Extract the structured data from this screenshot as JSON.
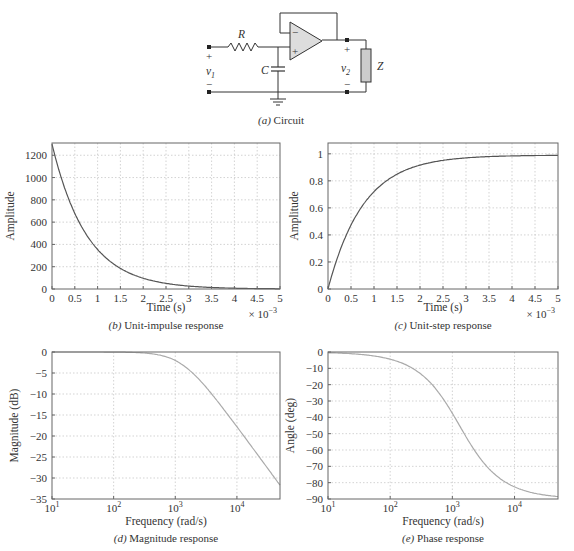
{
  "figure": {
    "circuit": {
      "caption_prefix": "(a)",
      "caption": "Circuit",
      "labels": {
        "R": "R",
        "C": "C",
        "Z": "Z",
        "v1": "v",
        "v1_sub": "1",
        "v2": "v",
        "v2_sub": "2",
        "plus": "+",
        "minus": "−"
      }
    },
    "colors": {
      "curve_time": "#555555",
      "curve_freq": "#aaaaaa",
      "grid": "#c8c8c8",
      "frame": "#666666",
      "opamp_fill": "#dddddd",
      "load_fill": "#cccccc"
    }
  },
  "chart_data": [
    {
      "id": "b",
      "type": "line",
      "title": "Unit-impulse response",
      "caption_prefix": "(b)",
      "xlabel": "Time (s)",
      "ylabel": "Amplitude",
      "x_multiplier": "× 10−3",
      "xlim": [
        0,
        5
      ],
      "ylim": [
        0,
        1310
      ],
      "xticks": [
        0,
        0.5,
        1,
        1.5,
        2,
        2.5,
        3,
        3.5,
        4,
        4.5,
        5
      ],
      "xtick_labels": [
        "0",
        "0.5",
        "1",
        "1.5",
        "2",
        "2.5",
        "3",
        "3.5",
        "4",
        "4.5",
        "5"
      ],
      "yticks": [
        0,
        200,
        400,
        600,
        800,
        1000,
        1200
      ],
      "ytick_labels": [
        "0",
        "200",
        "400",
        "600",
        "800",
        "1000",
        "1200"
      ],
      "grid": true,
      "x": [
        0,
        0.25,
        0.5,
        0.75,
        1,
        1.5,
        2,
        2.5,
        3,
        3.5,
        4,
        4.5,
        5
      ],
      "values": [
        1300,
        937,
        676,
        487,
        350,
        184,
        96,
        50,
        26,
        13.6,
        7.1,
        3.7,
        1.9
      ]
    },
    {
      "id": "c",
      "type": "line",
      "title": "Unit-step response",
      "caption_prefix": "(c)",
      "xlabel": "Time (s)",
      "ylabel": "Amplitude",
      "x_multiplier": "× 10−3",
      "xlim": [
        0,
        5
      ],
      "ylim": [
        0,
        1.08
      ],
      "xticks": [
        0,
        0.5,
        1,
        1.5,
        2,
        2.5,
        3,
        3.5,
        4,
        4.5,
        5
      ],
      "xtick_labels": [
        "0",
        "0.5",
        "1",
        "1.5",
        "2",
        "2.5",
        "3",
        "3.5",
        "4",
        "4.5",
        "5"
      ],
      "yticks": [
        0,
        0.2,
        0.4,
        0.6,
        0.8,
        1
      ],
      "ytick_labels": [
        "0",
        "0.2",
        "0.4",
        "0.6",
        "0.8",
        "1"
      ],
      "grid": true,
      "x": [
        0,
        0.25,
        0.5,
        0.75,
        1,
        1.5,
        2,
        2.5,
        3,
        3.5,
        4,
        4.5,
        5
      ],
      "values": [
        0,
        0.28,
        0.48,
        0.62,
        0.73,
        0.86,
        0.93,
        0.96,
        0.98,
        0.99,
        0.99,
        0.99,
        0.99
      ]
    },
    {
      "id": "d",
      "type": "line",
      "title": "Magnitude response",
      "caption_prefix": "(d)",
      "xlabel": "Frequency (rad/s)",
      "ylabel": "Magnitude (dB)",
      "xscale": "log",
      "xlim": [
        10,
        50000
      ],
      "ylim": [
        -35,
        0
      ],
      "xticks": [
        10,
        100,
        1000,
        10000
      ],
      "xtick_labels": [
        "10",
        "10",
        "10",
        "10"
      ],
      "xtick_exponents": [
        "1",
        "2",
        "3",
        "4"
      ],
      "yticks": [
        0,
        -5,
        -10,
        -15,
        -20,
        -25,
        -30,
        -35
      ],
      "ytick_labels": [
        "0",
        "−5",
        "−10",
        "−15",
        "−20",
        "−25",
        "−30",
        "−35"
      ],
      "grid": true,
      "x": [
        10,
        100,
        300,
        600,
        1000,
        1300,
        2000,
        3000,
        5000,
        10000,
        20000,
        50000
      ],
      "values": [
        0,
        -0.03,
        -0.23,
        -0.83,
        -2.1,
        -3.0,
        -5.2,
        -7.9,
        -11.9,
        -17.8,
        -23.7,
        -31.7
      ]
    },
    {
      "id": "e",
      "type": "line",
      "title": "Phase response",
      "caption_prefix": "(e)",
      "xlabel": "Frequency (rad/s)",
      "ylabel": "Angle (deg)",
      "xscale": "log",
      "xlim": [
        10,
        50000
      ],
      "ylim": [
        -90,
        0
      ],
      "xticks": [
        10,
        100,
        1000,
        10000
      ],
      "xtick_labels": [
        "10",
        "10",
        "10",
        "10"
      ],
      "xtick_exponents": [
        "1",
        "2",
        "3",
        "4"
      ],
      "yticks": [
        0,
        -10,
        -20,
        -30,
        -40,
        -50,
        -60,
        -70,
        -80,
        -90
      ],
      "ytick_labels": [
        "0",
        "−10",
        "−20",
        "−30",
        "−40",
        "−50",
        "−60",
        "−70",
        "−80",
        "−90"
      ],
      "grid": true,
      "x": [
        10,
        30,
        100,
        200,
        300,
        500,
        700,
        1000,
        1300,
        2000,
        3000,
        5000,
        10000,
        20000,
        50000
      ],
      "values": [
        -0.4,
        -1.3,
        -4.4,
        -8.7,
        -13.0,
        -21.0,
        -28.3,
        -37.6,
        -45.0,
        -57.0,
        -66.6,
        -75.4,
        -82.6,
        -86.3,
        -88.5
      ]
    }
  ]
}
